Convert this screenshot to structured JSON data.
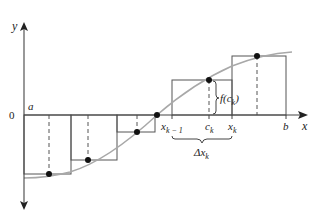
{
  "diagram": {
    "type": "riemann-sum-midpoint",
    "axes": {
      "x_label": "x",
      "y_label": "y",
      "origin_label": "0"
    },
    "interval": {
      "left_label": "a",
      "right_label": "b"
    },
    "annotations": {
      "x_k_minus_1": "x",
      "x_k_minus_1_sub": "k − 1",
      "c_k": "c",
      "c_k_sub": "k",
      "x_k": "x",
      "x_k_sub": "k",
      "f_c_k_prefix": "f(c",
      "f_c_k_sub": "k",
      "f_c_k_suffix": ")",
      "delta_x_k": "Δx",
      "delta_x_k_sub": "k"
    },
    "colors": {
      "curve": "#a8a8a8",
      "rect_stroke": "#555555",
      "axis": "#444444",
      "point": "#111111"
    }
  }
}
